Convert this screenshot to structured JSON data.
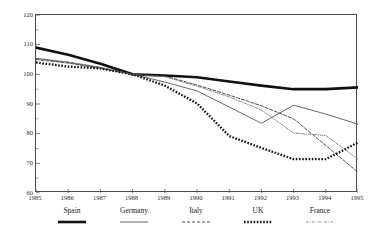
{
  "top_caption": "",
  "chart_data": {
    "type": "line",
    "title": "",
    "subtitle": "",
    "xlabel": "",
    "ylabel": "",
    "x": [
      1985,
      1986,
      1987,
      1988,
      1989,
      1990,
      1991,
      1992,
      1993,
      1994,
      1995
    ],
    "xtick_labels": [
      "1985",
      "1986",
      "1987",
      "1988",
      "1989",
      "1990",
      "1991",
      "1992",
      "1993",
      "1994",
      "1995"
    ],
    "ytick_labels": [
      "60",
      "70",
      "80",
      "90",
      "100",
      "110",
      "120"
    ],
    "yticks": [
      60,
      70,
      80,
      90,
      100,
      110,
      120
    ],
    "xlim": [
      1985,
      1995
    ],
    "ylim": [
      60,
      120
    ],
    "grid": false,
    "legend_position": "bottom",
    "index_base_year": 1988,
    "index_base_value": 100,
    "series": [
      {
        "name": "Spain",
        "style": "thick-solid",
        "color": "#111111",
        "width": 2.6,
        "dash": "",
        "values": [
          109.0,
          106.6,
          103.6,
          100.0,
          99.6,
          99.0,
          97.6,
          96.2,
          95.0,
          95.0,
          95.6
        ]
      },
      {
        "name": "Germany",
        "style": "thin-solid",
        "color": "#555555",
        "width": 0.9,
        "dash": "",
        "values": [
          105.4,
          104.0,
          102.2,
          100.0,
          97.4,
          94.4,
          89.0,
          83.5,
          89.6,
          86.6,
          83.2
        ]
      },
      {
        "name": "Italy",
        "style": "dashed",
        "color": "#3a3a3a",
        "width": 0.9,
        "dash": "3.2,1.8",
        "values": [
          105.0,
          103.8,
          102.0,
          100.0,
          99.4,
          96.4,
          93.0,
          89.4,
          85.0,
          76.0,
          67.0
        ]
      },
      {
        "name": "UK",
        "style": "thick-dotted",
        "color": "#101010",
        "width": 2.3,
        "dash": "1.6,1.6",
        "values": [
          104.0,
          102.6,
          102.0,
          100.0,
          96.2,
          90.2,
          79.2,
          75.2,
          71.4,
          71.4,
          77.0
        ]
      },
      {
        "name": "France",
        "style": "dash-dot-fine",
        "color": "#6b6b6b",
        "width": 0.8,
        "dash": "2.6,1.4,0.7,1.4",
        "values": [
          105.2,
          104.2,
          102.4,
          100.0,
          99.2,
          96.0,
          92.4,
          88.0,
          80.2,
          79.4,
          71.4
        ]
      }
    ]
  },
  "legend": {
    "items": [
      {
        "label": "Spain"
      },
      {
        "label": "Germany"
      },
      {
        "label": "Italy"
      },
      {
        "label": "UK"
      },
      {
        "label": "France"
      }
    ]
  }
}
